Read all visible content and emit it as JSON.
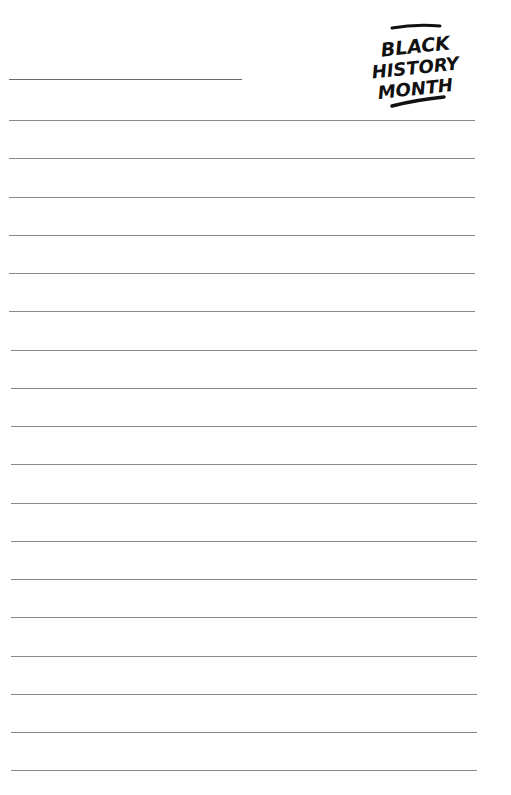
{
  "logo": {
    "lines": [
      "BLACK",
      "HISTORY",
      "MONTH"
    ],
    "icon": "black-history-month-logo"
  },
  "name_field": {
    "value": ""
  },
  "ruled_lines": {
    "count": 18,
    "first_y": 120,
    "spacing": 38.25,
    "left": 11,
    "right": 477
  },
  "colors": {
    "line": "#8a8a8a",
    "text": "#111111",
    "background": "#ffffff"
  }
}
